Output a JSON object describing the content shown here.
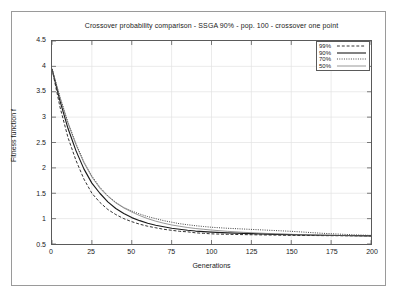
{
  "chart_data": {
    "type": "line",
    "title": "Crossover probability comparison - SSGA 90% - pop. 100 - crossover one point",
    "xlabel": "Generations",
    "ylabel": "Fitness function f",
    "xlim": [
      0,
      200
    ],
    "ylim": [
      0.5,
      4.5
    ],
    "xticks": [
      0,
      25,
      50,
      75,
      100,
      125,
      150,
      175,
      200
    ],
    "yticks": [
      0.5,
      1,
      1.5,
      2,
      2.5,
      3,
      3.5,
      4,
      4.5
    ],
    "grid": true,
    "legend_position": "top-right",
    "x": [
      0,
      5,
      10,
      15,
      20,
      25,
      30,
      35,
      40,
      45,
      50,
      55,
      60,
      65,
      70,
      75,
      80,
      85,
      90,
      95,
      100,
      110,
      120,
      130,
      140,
      150,
      160,
      170,
      180,
      190,
      200
    ],
    "series": [
      {
        "name": "99%",
        "style": "dashed",
        "color": "#1a1a1a",
        "values": [
          3.95,
          3.2,
          2.6,
          2.15,
          1.78,
          1.5,
          1.32,
          1.18,
          1.08,
          1.0,
          0.94,
          0.89,
          0.85,
          0.82,
          0.79,
          0.77,
          0.75,
          0.74,
          0.72,
          0.71,
          0.7,
          0.69,
          0.685,
          0.68,
          0.675,
          0.67,
          0.668,
          0.665,
          0.663,
          0.661,
          0.66
        ]
      },
      {
        "name": "90%",
        "style": "solid",
        "color": "#1a1a1a",
        "values": [
          3.95,
          3.32,
          2.78,
          2.34,
          1.98,
          1.7,
          1.5,
          1.33,
          1.2,
          1.1,
          1.02,
          0.96,
          0.91,
          0.87,
          0.84,
          0.81,
          0.79,
          0.77,
          0.755,
          0.745,
          0.735,
          0.72,
          0.71,
          0.7,
          0.69,
          0.685,
          0.678,
          0.672,
          0.668,
          0.664,
          0.66
        ]
      },
      {
        "name": "70%",
        "style": "dotted",
        "color": "#2a2a2a",
        "values": [
          3.95,
          3.4,
          2.9,
          2.48,
          2.12,
          1.84,
          1.62,
          1.45,
          1.32,
          1.22,
          1.15,
          1.09,
          1.04,
          1.0,
          0.96,
          0.93,
          0.9,
          0.88,
          0.86,
          0.845,
          0.83,
          0.81,
          0.795,
          0.78,
          0.765,
          0.75,
          0.73,
          0.71,
          0.695,
          0.68,
          0.67
        ]
      },
      {
        "name": "50%",
        "style": "thin-solid",
        "color": "#6a6a6a",
        "values": [
          3.95,
          3.38,
          2.88,
          2.46,
          2.1,
          1.82,
          1.6,
          1.44,
          1.31,
          1.21,
          1.13,
          1.06,
          1.0,
          0.95,
          0.91,
          0.875,
          0.85,
          0.825,
          0.805,
          0.79,
          0.775,
          0.75,
          0.73,
          0.715,
          0.7,
          0.69,
          0.682,
          0.675,
          0.67,
          0.665,
          0.66
        ]
      }
    ]
  },
  "axis": {
    "yticks_labels": [
      "4.5",
      "4",
      "3.5",
      "3",
      "2.5",
      "2",
      "1.5",
      "1",
      "0.5"
    ],
    "xticks_labels": [
      "0",
      "25",
      "50",
      "75",
      "100",
      "125",
      "150",
      "175",
      "200"
    ]
  },
  "legend": {
    "entries": [
      {
        "label": "99%"
      },
      {
        "label": "90%"
      },
      {
        "label": "70%"
      },
      {
        "label": "50%"
      }
    ]
  }
}
